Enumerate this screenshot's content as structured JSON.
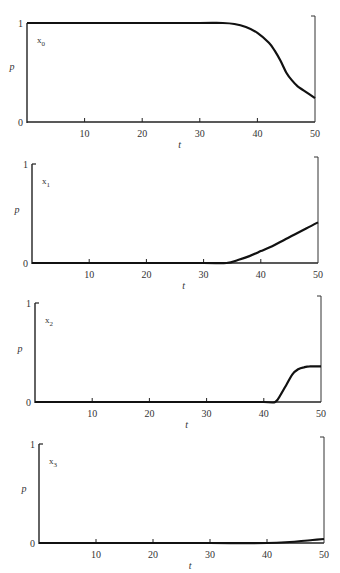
{
  "chart_data": [
    {
      "type": "line",
      "panel_label": "x0",
      "series_name": "x",
      "series_sub": "0",
      "xlabel": "t",
      "ylabel": "p",
      "xlim": [
        0,
        50
      ],
      "ylim": [
        0,
        1
      ],
      "xticks": [
        "10",
        "20",
        "30",
        "40",
        "50"
      ],
      "yticks": [
        "0",
        "1"
      ],
      "x": [
        0,
        10,
        20,
        30,
        34,
        36,
        38,
        40,
        42,
        43,
        44,
        45,
        46,
        47,
        48,
        50
      ],
      "y": [
        1.0,
        1.0,
        1.0,
        1.0,
        1.0,
        0.99,
        0.96,
        0.9,
        0.8,
        0.72,
        0.62,
        0.5,
        0.42,
        0.36,
        0.32,
        0.24
      ],
      "grid": false
    },
    {
      "type": "line",
      "panel_label": "x1",
      "series_name": "x",
      "series_sub": "1",
      "xlabel": "t",
      "ylabel": "p",
      "xlim": [
        0,
        50
      ],
      "ylim": [
        0,
        1
      ],
      "xticks": [
        "10",
        "20",
        "30",
        "40",
        "50"
      ],
      "yticks": [
        "0",
        "1"
      ],
      "x": [
        0,
        10,
        20,
        30,
        34,
        36,
        38,
        40,
        42,
        44,
        46,
        48,
        50
      ],
      "y": [
        0.0,
        0.0,
        0.0,
        0.0,
        0.0,
        0.03,
        0.07,
        0.12,
        0.17,
        0.23,
        0.29,
        0.35,
        0.41
      ],
      "grid": false
    },
    {
      "type": "line",
      "panel_label": "x2",
      "series_name": "x",
      "series_sub": "2",
      "xlabel": "t",
      "ylabel": "p",
      "xlim": [
        0,
        50
      ],
      "ylim": [
        0,
        1
      ],
      "xticks": [
        "10",
        "20",
        "30",
        "40",
        "50"
      ],
      "yticks": [
        "0",
        "1"
      ],
      "x": [
        0,
        10,
        20,
        30,
        40,
        42,
        43,
        44,
        45,
        46,
        47,
        48,
        50
      ],
      "y": [
        0.0,
        0.0,
        0.0,
        0.0,
        0.0,
        0.0,
        0.08,
        0.18,
        0.28,
        0.33,
        0.35,
        0.36,
        0.36
      ],
      "grid": false
    },
    {
      "type": "line",
      "panel_label": "x3",
      "series_name": "x",
      "series_sub": "3",
      "xlabel": "t",
      "ylabel": "p",
      "xlim": [
        0,
        50
      ],
      "ylim": [
        0,
        1
      ],
      "xticks": [
        "10",
        "20",
        "30",
        "40",
        "50"
      ],
      "yticks": [
        "0",
        "1"
      ],
      "x": [
        0,
        10,
        20,
        30,
        40,
        44,
        46,
        48,
        50
      ],
      "y": [
        0.0,
        0.0,
        0.0,
        0.0,
        0.0,
        0.01,
        0.02,
        0.03,
        0.04
      ],
      "grid": false
    }
  ]
}
